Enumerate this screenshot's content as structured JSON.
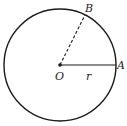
{
  "diagram": {
    "labels": {
      "B": "B",
      "A": "A",
      "O": "O",
      "r": "r"
    },
    "colors": {
      "stroke": "#1a1a1a",
      "background": "#ffffff"
    }
  }
}
